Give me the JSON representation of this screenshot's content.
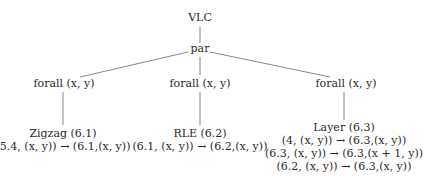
{
  "root": {
    "label": "VLC"
  },
  "par": {
    "label": "par"
  },
  "branches": [
    {
      "forall": "forall (x, y)",
      "name": "Zigzag (6.1)",
      "rules": [
        "(5.4, (x, y))  →  (6.1,(x, y))"
      ]
    },
    {
      "forall": "forall (x, y)",
      "name": "RLE (6.2)",
      "rules": [
        "(6.1, (x, y))  →  (6.2,(x, y))"
      ]
    },
    {
      "forall": "forall (x, y)",
      "name": "Layer (6.3)",
      "rules": [
        "(4, (x, y)) → (6.3,(x, y))",
        "(6.3, (x, y)) → (6.3,(x + 1, y))",
        "(6.2, (x, y)) → (6.3,(x, y))"
      ]
    }
  ],
  "colors": {
    "line": "#888888",
    "text": "#2a2a2a"
  }
}
